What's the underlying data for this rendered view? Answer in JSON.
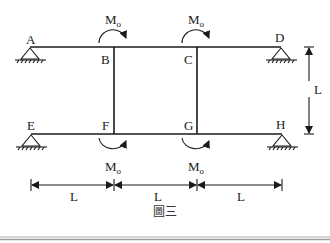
{
  "diagram": {
    "caption": "圖三",
    "nodes": {
      "A": "A",
      "B": "B",
      "C": "C",
      "D": "D",
      "E": "E",
      "F": "F",
      "G": "G",
      "H": "H"
    },
    "moments": {
      "symbol": "M",
      "subscript": "o",
      "B": {
        "label": "Mo",
        "direction": "clockwise"
      },
      "C": {
        "label": "Mo",
        "direction": "clockwise"
      },
      "F": {
        "label": "Mo",
        "direction": "counterclockwise"
      },
      "G": {
        "label": "Mo",
        "direction": "counterclockwise"
      }
    },
    "dimensions": {
      "vertical": "L",
      "horizontal": [
        "L",
        "L",
        "L"
      ]
    },
    "supports": [
      "A",
      "D",
      "E",
      "H"
    ],
    "colors": {
      "ink": "#1a1a1a",
      "border": "#b0b0b0"
    }
  }
}
